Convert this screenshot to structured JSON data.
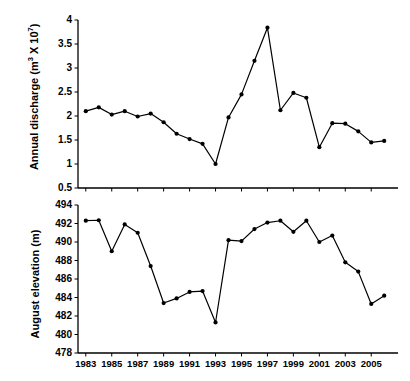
{
  "chart_data": [
    {
      "id": "annual-discharge",
      "type": "line",
      "title": "",
      "xlabel": "",
      "ylabel": "Annual discharge (m3 X 107)",
      "ylabel_parts": {
        "main": "Annual discharge (m",
        "sup1": "3",
        "mid": " X 10",
        "sup2": "7",
        "end": ")"
      },
      "x": [
        1983,
        1984,
        1985,
        1986,
        1987,
        1988,
        1989,
        1990,
        1991,
        1992,
        1993,
        1994,
        1995,
        1996,
        1997,
        1998,
        1999,
        2000,
        2001,
        2002,
        2003,
        2004,
        2005,
        2006
      ],
      "values": [
        2.1,
        2.18,
        2.03,
        2.1,
        1.99,
        2.05,
        1.87,
        1.63,
        1.52,
        1.42,
        1.0,
        1.97,
        2.45,
        3.15,
        3.84,
        2.12,
        2.48,
        2.38,
        1.35,
        1.85,
        1.84,
        1.68,
        1.45,
        1.48
      ],
      "xlim": [
        1982.4,
        2006.6
      ],
      "ylim": [
        0.5,
        4
      ],
      "yticks": [
        0.5,
        1,
        1.5,
        2,
        2.5,
        3,
        3.5,
        4
      ],
      "yticklabels": [
        "0.5",
        "1",
        "1.5",
        "2",
        "2.5",
        "3",
        "3.5",
        "4"
      ],
      "xticks": [
        1983,
        1985,
        1987,
        1989,
        1991,
        1993,
        1995,
        1997,
        1999,
        2001,
        2003,
        2005
      ],
      "xticklabels": [],
      "grid": false,
      "legend": null,
      "marker": "circle",
      "line_color": "#000000",
      "marker_color": "#000000"
    },
    {
      "id": "august-elevation",
      "type": "line",
      "title": "",
      "xlabel": "",
      "ylabel": "August elevation (m)",
      "x": [
        1983,
        1984,
        1985,
        1986,
        1987,
        1988,
        1989,
        1990,
        1991,
        1992,
        1993,
        1994,
        1995,
        1996,
        1997,
        1998,
        1999,
        2000,
        2001,
        2002,
        2003,
        2004,
        2005,
        2006
      ],
      "values": [
        492.3,
        492.35,
        489.0,
        491.9,
        491.0,
        487.4,
        483.4,
        483.9,
        484.6,
        484.7,
        481.3,
        490.2,
        490.1,
        491.4,
        492.1,
        492.3,
        491.1,
        492.3,
        490.0,
        490.7,
        487.8,
        486.8,
        483.3,
        484.2
      ],
      "xlim": [
        1982.4,
        2006.6
      ],
      "ylim": [
        478,
        494
      ],
      "yticks": [
        478,
        480,
        482,
        484,
        486,
        488,
        490,
        492,
        494
      ],
      "yticklabels": [
        "478",
        "480",
        "482",
        "484",
        "486",
        "488",
        "490",
        "492",
        "494"
      ],
      "xticks": [
        1983,
        1985,
        1987,
        1989,
        1991,
        1993,
        1995,
        1997,
        1999,
        2001,
        2003,
        2005
      ],
      "xticklabels": [
        "1983",
        "1985",
        "1987",
        "1989",
        "1991",
        "1993",
        "1995",
        "1997",
        "1999",
        "2001",
        "2003",
        "2005"
      ],
      "grid": false,
      "legend": null,
      "marker": "circle",
      "line_color": "#000000",
      "marker_color": "#000000"
    }
  ],
  "colors": {
    "background": "#ffffff",
    "axis": "#000000",
    "series": "#000000"
  }
}
